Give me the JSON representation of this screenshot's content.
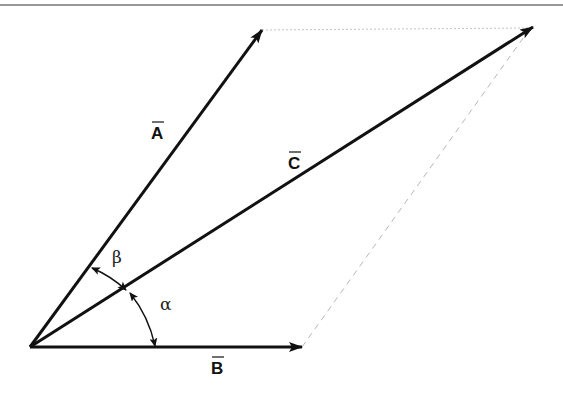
{
  "diagram": {
    "colors": {
      "stroke": "#111111",
      "guide": "#b8b8b8",
      "border": "#333333",
      "background": "#ffffff"
    },
    "origin": [
      30,
      347
    ],
    "vectors": [
      {
        "id": "A",
        "label": "A",
        "overline": true,
        "tip": [
          262,
          30
        ],
        "label_pos": [
          157,
          138
        ]
      },
      {
        "id": "B",
        "label": "B",
        "overline": true,
        "tip": [
          302,
          347
        ],
        "label_pos": [
          218,
          375
        ]
      },
      {
        "id": "C",
        "label": "C",
        "overline": true,
        "tip": [
          533,
          27
        ],
        "label_pos": [
          294,
          168
        ]
      }
    ],
    "guides": [
      {
        "from": "A_tip",
        "to": "C_tip",
        "style": "dotted"
      },
      {
        "from": "B_tip",
        "to": "C_tip",
        "style": "dashed"
      }
    ],
    "angles": [
      {
        "id": "beta",
        "label": "β",
        "between": [
          "A",
          "C"
        ],
        "label_pos": [
          112,
          262
        ]
      },
      {
        "id": "alpha",
        "label": "α",
        "between": [
          "C",
          "B"
        ],
        "label_pos": [
          160,
          310
        ]
      }
    ]
  }
}
